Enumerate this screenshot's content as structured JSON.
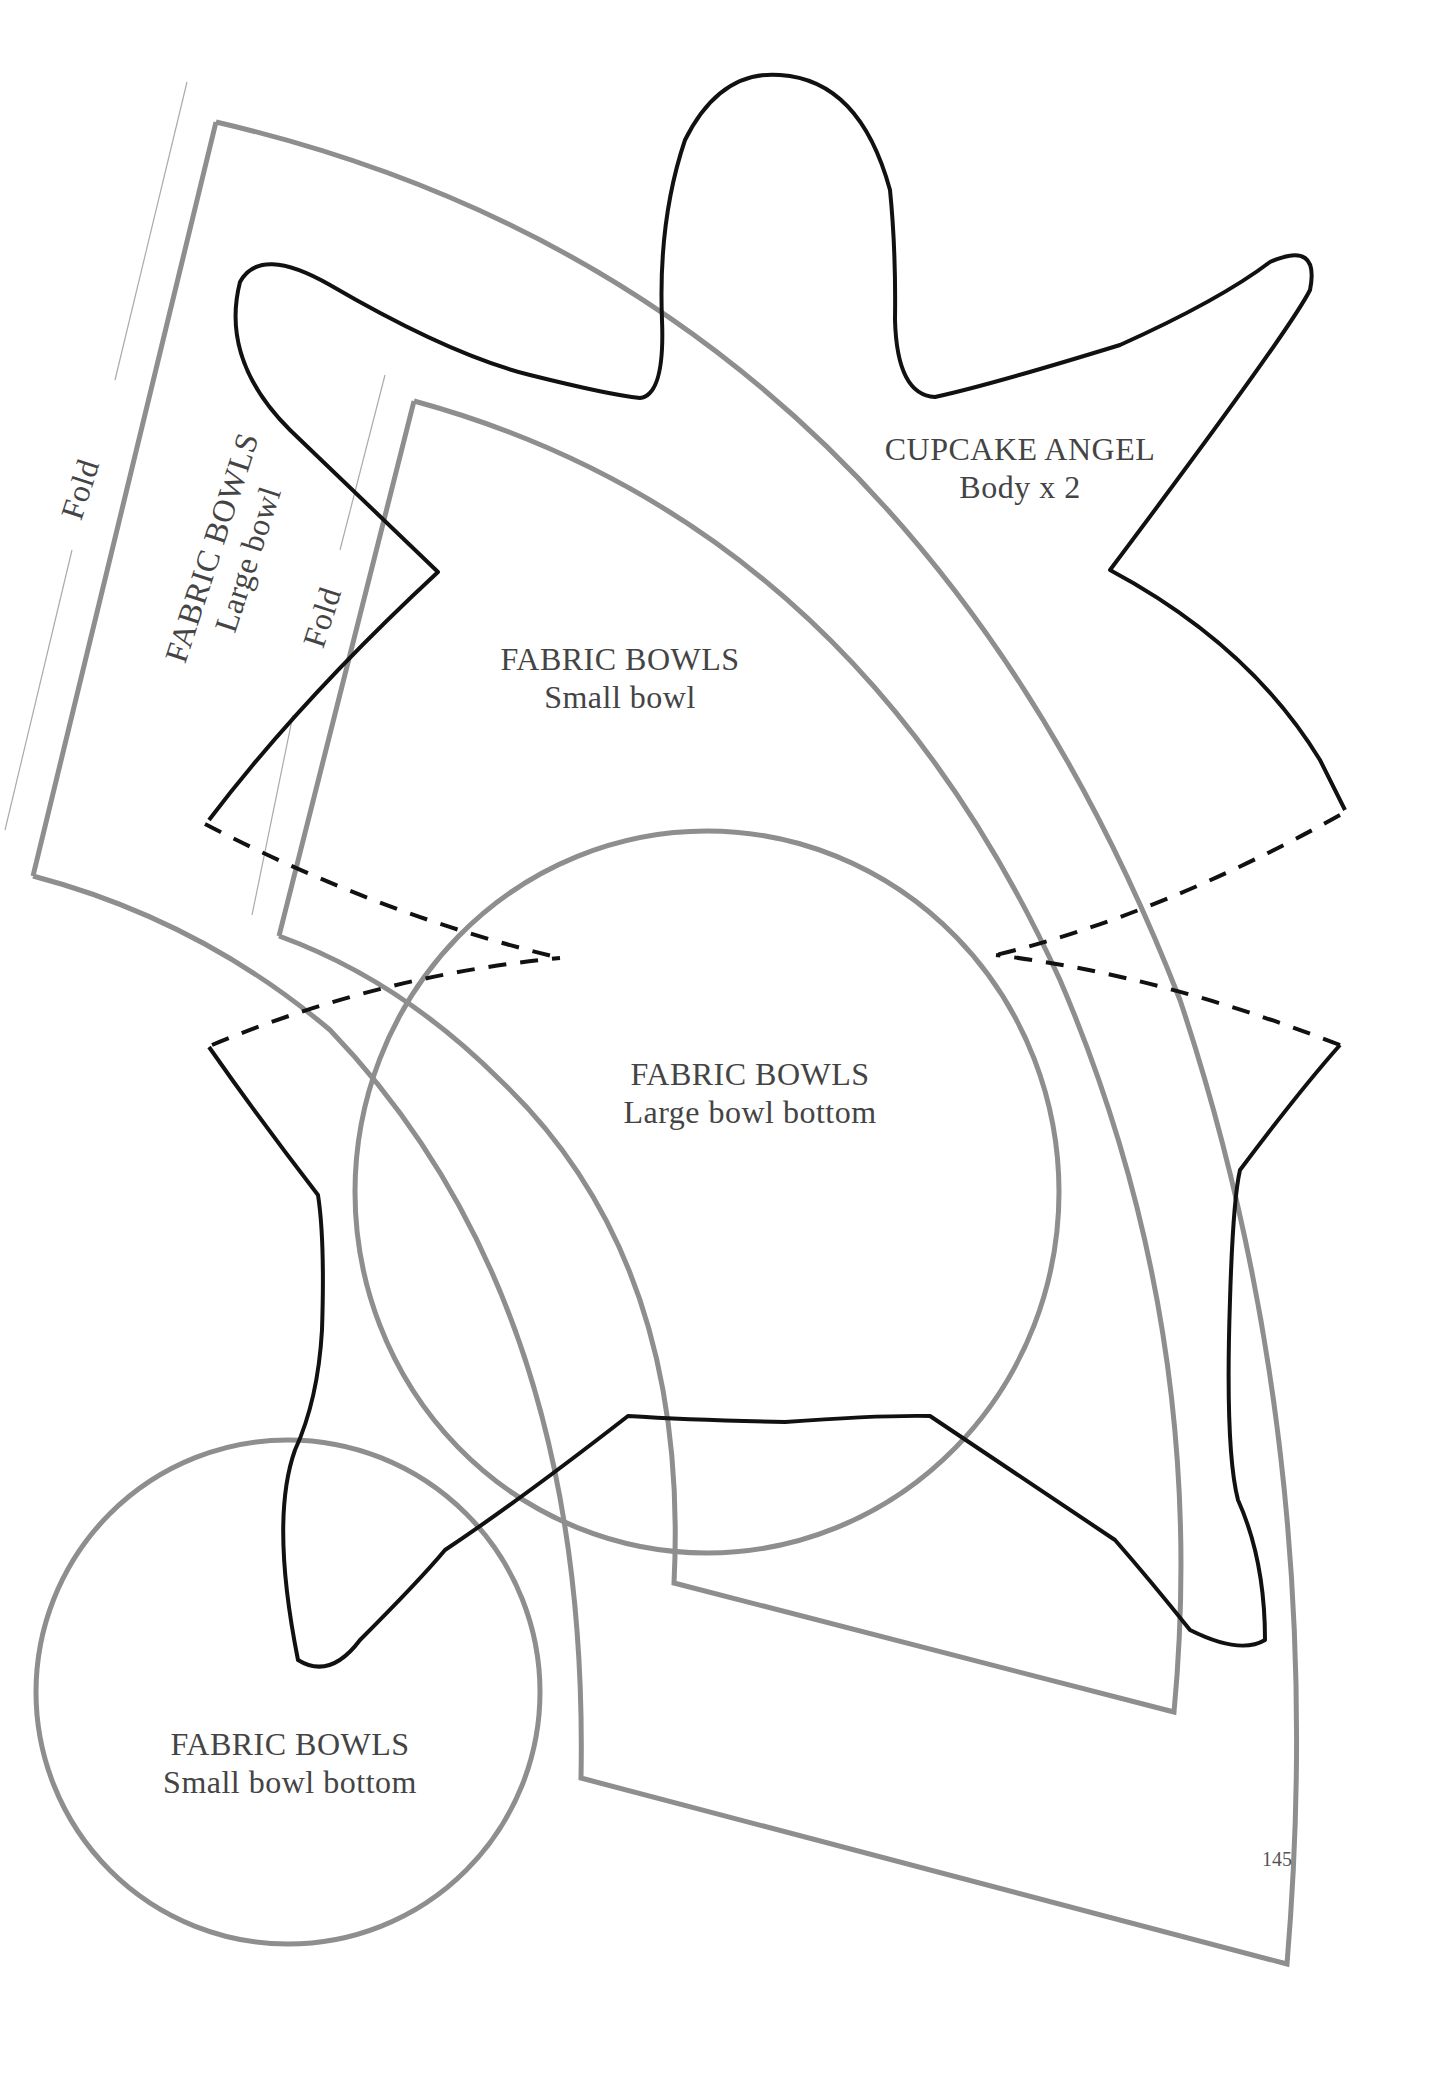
{
  "page": {
    "number": "145",
    "colors": {
      "pattern_gray": "#8e8e8e",
      "angel_black": "#111111",
      "text": "#444444",
      "background": "#ffffff"
    }
  },
  "patterns": {
    "cupcake_angel": {
      "title": "CUPCAKE ANGEL",
      "subtitle": "Body x 2"
    },
    "small_bowl": {
      "title": "FABRIC BOWLS",
      "subtitle": "Small bowl",
      "fold_label": "Fold"
    },
    "large_bowl": {
      "title": "FABRIC BOWLS",
      "subtitle": "Large bowl",
      "fold_label": "Fold"
    },
    "large_bowl_bottom": {
      "title": "FABRIC BOWLS",
      "subtitle": "Large bowl bottom"
    },
    "small_bowl_bottom": {
      "title": "FABRIC BOWLS",
      "subtitle": "Small bowl bottom"
    }
  }
}
